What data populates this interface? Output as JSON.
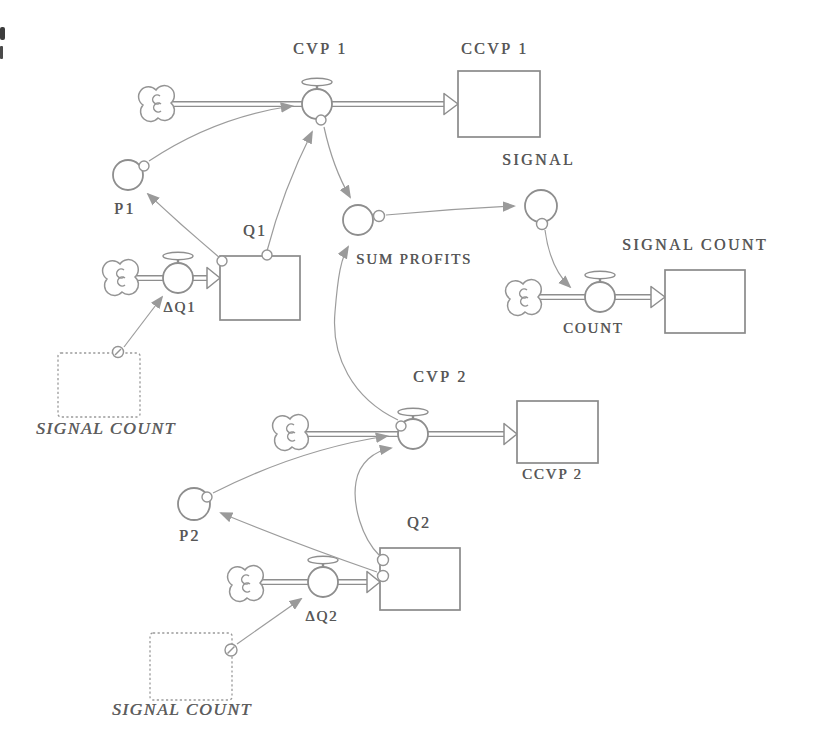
{
  "figure": {
    "type": "stock-and-flow-diagram",
    "labels": {
      "cvp1": "CVP 1",
      "ccvp1": "CCVP 1",
      "p1": "P1",
      "q1": "Q1",
      "dq1": "ΔQ1",
      "ghost1": "SIGNAL COUNT",
      "sum_profits": "SUM PROFITS",
      "signal": "SIGNAL",
      "signal_count": "SIGNAL COUNT",
      "count": "COUNT",
      "cvp2": "CVP 2",
      "ccvp2": "CCVP 2",
      "p2": "P2",
      "q2": "Q2",
      "dq2": "ΔQ2",
      "ghost2": "SIGNAL COUNT"
    },
    "colors": {
      "shape_line": "#8e8e8e",
      "connector_line": "#9a9a9a",
      "text": "#565656",
      "background": "#ffffff"
    }
  }
}
